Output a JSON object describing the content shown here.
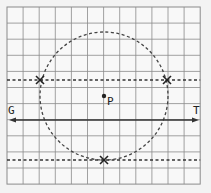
{
  "diagram": {
    "type": "locus-construction",
    "grid": {
      "x0": 7,
      "y0": 7,
      "cols": 12,
      "rows": 11,
      "cell": 16.1,
      "line_color": "#8a8a8a"
    },
    "circle": {
      "cx": 104,
      "cy": 96,
      "r": 64,
      "style": "dashed"
    },
    "point": {
      "label": "P",
      "x": 104,
      "y": 96
    },
    "arrow_line": {
      "y": 120,
      "x1": 9,
      "x2": 199,
      "left_label": "G",
      "right_label": "T"
    },
    "dashed_lines": [
      {
        "y": 80
      },
      {
        "y": 160
      }
    ],
    "crosses": [
      {
        "x": 40,
        "y": 80
      },
      {
        "x": 167,
        "y": 80
      },
      {
        "x": 104,
        "y": 160
      }
    ],
    "colors": {
      "ink": "#333333",
      "grid": "#8a8a8a",
      "paper": "#f3f3f3"
    }
  }
}
